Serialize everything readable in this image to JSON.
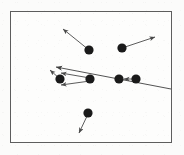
{
  "figure": {
    "width": 184,
    "height": 155
  },
  "panel": {
    "x": 10,
    "y": 11,
    "width": 162,
    "height": 132,
    "border_color": "#5d5d5d",
    "border_width": 1.3,
    "fill_color": "#fdfdfc"
  },
  "style": {
    "background_color": "#fbfbfa",
    "dot_color": "#1a1a1a",
    "arrow_color": "#4a4a4a",
    "ray_color": "#3f3f3f",
    "dot_radius": 4.6,
    "arrow_width": 0.9
  },
  "chart_data": {
    "type": "scatter",
    "title": "",
    "xlabel": "",
    "ylabel": "",
    "grid": false,
    "legend": "none",
    "xlim": [
      10,
      172
    ],
    "ylim": [
      11,
      143
    ],
    "dots": [
      {
        "name": "dot-top-left",
        "x": 89,
        "y": 50
      },
      {
        "name": "dot-top-right",
        "x": 122,
        "y": 48
      },
      {
        "name": "dot-mid-left",
        "x": 60,
        "y": 79
      },
      {
        "name": "dot-mid-center",
        "x": 90,
        "y": 79
      },
      {
        "name": "dot-mid-right-a",
        "x": 119,
        "y": 79
      },
      {
        "name": "dot-mid-right-b",
        "x": 136,
        "y": 79
      },
      {
        "name": "dot-bottom",
        "x": 88,
        "y": 113
      }
    ],
    "arrows": [
      {
        "name": "arrow-top-left-upleft",
        "x1": 89,
        "y1": 50,
        "x2": 63,
        "y2": 29
      },
      {
        "name": "arrow-top-right-upright",
        "x1": 122,
        "y1": 48,
        "x2": 155,
        "y2": 37
      },
      {
        "name": "arrow-mid-center-to-left-upper",
        "x1": 90,
        "y1": 78,
        "x2": 61,
        "y2": 73
      },
      {
        "name": "arrow-mid-center-to-left-lower",
        "x1": 90,
        "y1": 81,
        "x2": 61,
        "y2": 85
      },
      {
        "name": "arrow-mid-left-short",
        "x1": 60,
        "y1": 79,
        "x2": 50,
        "y2": 70
      },
      {
        "name": "arrow-mid-right-b-to-a",
        "x1": 136,
        "y1": 79,
        "x2": 124,
        "y2": 79
      },
      {
        "name": "arrow-bottom-downleft",
        "x1": 88,
        "y1": 114,
        "x2": 79,
        "y2": 133
      }
    ],
    "rays": [
      {
        "name": "ray-long-traversing",
        "x1": 171,
        "y1": 89,
        "x2": 56,
        "y2": 67,
        "arrowhead_at": "x2"
      }
    ]
  }
}
